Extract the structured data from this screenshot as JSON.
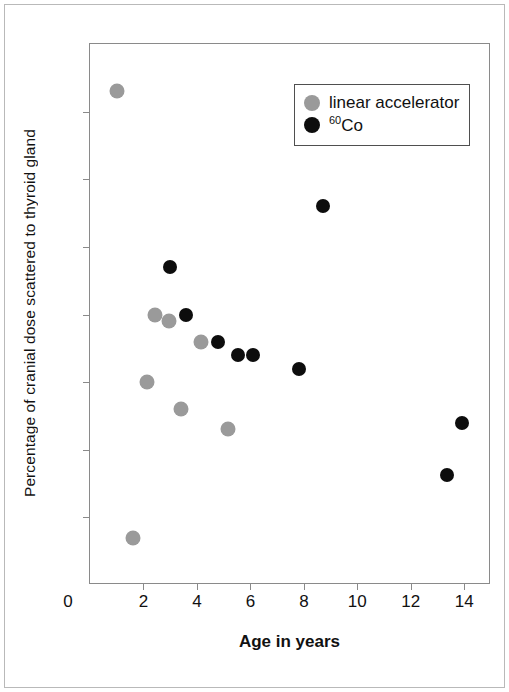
{
  "chart_data": {
    "type": "scatter",
    "title": "",
    "xlabel": "Age in years",
    "ylabel": "Percentage of cranial dose scattered to thyroid gland",
    "xlim": [
      0,
      15
    ],
    "ylim": [
      0,
      8
    ],
    "xticks": [
      0,
      2,
      4,
      6,
      8,
      10,
      12,
      14
    ],
    "yticks": [
      0,
      1,
      2,
      3,
      4,
      5,
      6,
      7,
      8
    ],
    "xtick_labels": [
      "0",
      "2",
      "4",
      "6",
      "8",
      "10",
      "12",
      "14"
    ],
    "ytick_labels": [
      "0",
      "1",
      "2",
      "3",
      "4",
      "5",
      "6",
      "7",
      "8"
    ],
    "grid": false,
    "legend_position": "upper right",
    "series": [
      {
        "name": "linear accelerator",
        "color": "#9a9a9a",
        "marker": "circle",
        "points": [
          {
            "x": 1.0,
            "y": 7.3
          },
          {
            "x": 2.45,
            "y": 4.0
          },
          {
            "x": 2.95,
            "y": 3.9
          },
          {
            "x": 4.15,
            "y": 3.6
          },
          {
            "x": 2.15,
            "y": 3.0
          },
          {
            "x": 3.4,
            "y": 2.6
          },
          {
            "x": 5.15,
            "y": 2.3
          },
          {
            "x": 1.6,
            "y": 0.7
          }
        ]
      },
      {
        "name": "60Co",
        "name_sup": "60",
        "name_base": "Co",
        "color": "#0d0d0d",
        "marker": "circle",
        "points": [
          {
            "x": 3.0,
            "y": 4.7
          },
          {
            "x": 3.6,
            "y": 4.0
          },
          {
            "x": 4.8,
            "y": 3.6
          },
          {
            "x": 5.55,
            "y": 3.4
          },
          {
            "x": 6.1,
            "y": 3.4
          },
          {
            "x": 7.8,
            "y": 3.2
          },
          {
            "x": 8.7,
            "y": 5.6
          },
          {
            "x": 13.35,
            "y": 1.62
          },
          {
            "x": 13.9,
            "y": 2.4
          }
        ]
      }
    ]
  },
  "legend": {
    "items": [
      {
        "label": "linear accelerator",
        "color": "#9a9a9a"
      },
      {
        "label": "60Co",
        "sup": "60",
        "base": "Co",
        "color": "#0d0d0d"
      }
    ]
  },
  "axes": {
    "x_title": "Age in years",
    "y_title": "Percentage of cranial dose scattered to thyroid gland"
  }
}
